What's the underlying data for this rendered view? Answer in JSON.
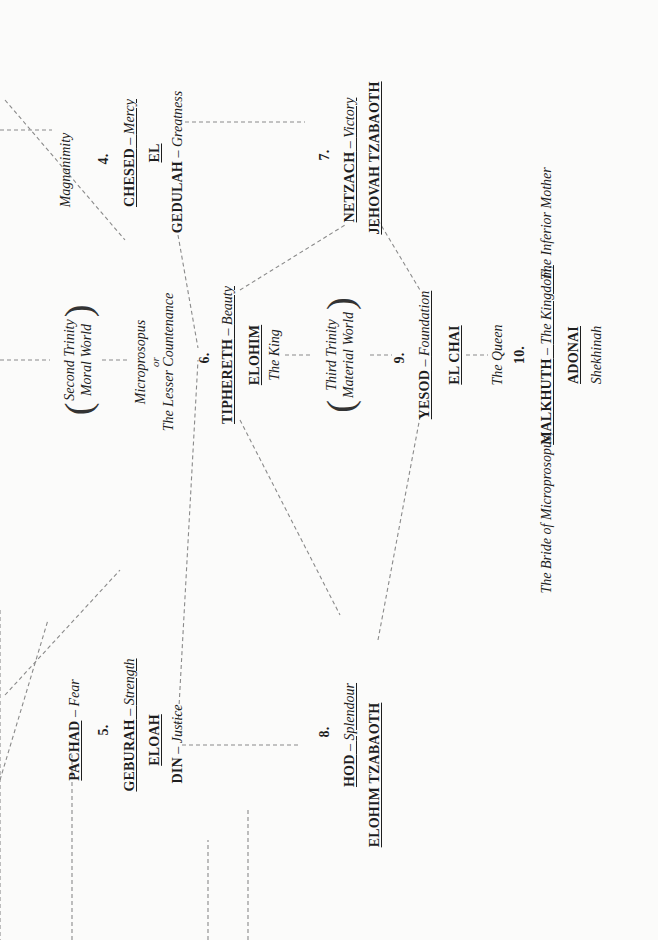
{
  "diagram": {
    "orientation": "rotated -90 degrees (text reads bottom to top)",
    "line_color": "#8a8a8a",
    "text_color": "#1e1e1e",
    "background": "#fbfbfa"
  },
  "pillars": {
    "severity": {
      "pachad": {
        "name": "PACHAD",
        "sep": " – ",
        "meaning": "Fear"
      },
      "geburah": {
        "number": "5.",
        "name": "GEBURAH",
        "sep": " – ",
        "meaning": "Strength",
        "god_name": "ELOAH",
        "alt_name": "DIN",
        "alt_meaning": "Justice"
      },
      "hod": {
        "number": "8.",
        "name": "HOD",
        "sep": " – ",
        "meaning": "Splendour",
        "god_name": "ELOHIM TZABAOTH"
      }
    },
    "middle": {
      "second_trinity": {
        "line1": "Second Trinity",
        "line2": "Moral World"
      },
      "microprosopus": {
        "line1": "Microprosopus",
        "line2": "or",
        "line3": "The Lesser Countenance"
      },
      "tiphereth": {
        "number": "6.",
        "name": "TIPHERETH",
        "sep": " – ",
        "meaning": "Beauty",
        "god_name": "ELOHIM",
        "title": "The King"
      },
      "third_trinity": {
        "line1": "Third Trinity",
        "line2": "Material World"
      },
      "yesod": {
        "number": "9.",
        "name": "YESOD",
        "sep": " – ",
        "meaning": "Foundation",
        "god_name": "EL CHAI"
      },
      "malkhuth": {
        "title_above": "The Queen",
        "number": "10.",
        "name": "MALKHUTH",
        "sep": " – ",
        "meaning": "The Kingdom,",
        "left_note": "The Bride of Microprosopus,",
        "right_note": "The Inferior Mother",
        "god_name": "ADONAI",
        "subtitle": "Shekhinah"
      }
    },
    "mercy": {
      "magnanimity": "Magnanimity",
      "chesed": {
        "number": "4.",
        "name": "CHESED",
        "sep": " – ",
        "meaning": "Mercy",
        "god_name": "EL",
        "alt_name": "GEDULAH",
        "alt_meaning": "Greatness"
      },
      "netzach": {
        "number": "7.",
        "name": "NETZACH",
        "sep": " – ",
        "meaning": "Victory",
        "god_name": "JEHOVAH TZABAOTH"
      }
    }
  }
}
